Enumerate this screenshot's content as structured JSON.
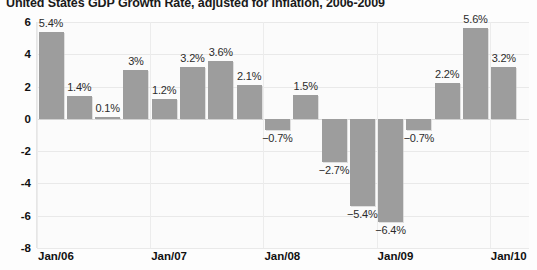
{
  "chart_data": {
    "type": "bar",
    "title": "United States GDP Growth Rate, adjusted for inflation, 2006-2009",
    "xlabel": "",
    "ylabel": "",
    "ylim": [
      -8,
      6
    ],
    "grid": true,
    "legend": false,
    "yticks": [
      6,
      4,
      2,
      0,
      -2,
      -4,
      -6,
      -8
    ],
    "ytick_labels": [
      "6",
      "4",
      "2",
      "0",
      "-2",
      "-4",
      "-6",
      "-8"
    ],
    "xtick_labels": [
      "Jan/06",
      "Jan/07",
      "Jan/08",
      "Jan/09",
      "Jan/10"
    ],
    "categories": [
      "2006 Q1",
      "2006 Q2",
      "2006 Q3",
      "2006 Q4",
      "2007 Q1",
      "2007 Q2",
      "2007 Q3",
      "2007 Q4",
      "2008 Q1",
      "2008 Q2",
      "2008 Q3",
      "2008 Q4",
      "2009 Q1",
      "2009 Q2",
      "2009 Q3",
      "2009 Q4"
    ],
    "values": [
      5.4,
      1.4,
      0.1,
      3,
      1.2,
      3.2,
      3.6,
      2.1,
      -0.7,
      1.5,
      -2.7,
      -5.4,
      -6.4,
      -0.7,
      2.2,
      5.6
    ],
    "data_labels": [
      "5.4%",
      "1.4%",
      "0.1%",
      "3%",
      "1.2%",
      "3.2%",
      "3.6%",
      "2.1%",
      "-0.7%",
      "1.5%",
      "-2.7%",
      "-5.4%",
      "-6.4%",
      "-0.7%",
      "2.2%",
      "5.6%"
    ],
    "extra_value": 3.2,
    "extra_label": "3.2%",
    "bar_color": "#9d9d9d",
    "grid_color": "#e9e9e9",
    "background_color": "#fbfbfb",
    "text_color": "#111111"
  }
}
